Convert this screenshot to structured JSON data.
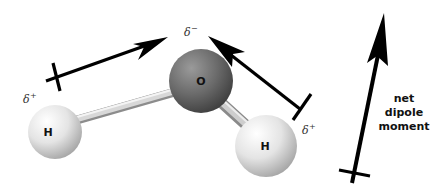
{
  "diagram": {
    "atoms": [
      {
        "id": "oxygen",
        "label": "O",
        "cx": 201,
        "cy": 81,
        "r": 32,
        "color": "#6a6a6a"
      },
      {
        "id": "hydrogen-left",
        "label": "H",
        "cx": 55,
        "cy": 132,
        "r": 27,
        "color": "#e6e6e6"
      },
      {
        "id": "hydrogen-right",
        "label": "H",
        "cx": 266,
        "cy": 146,
        "r": 31,
        "color": "#e6e6e6"
      }
    ],
    "charges": {
      "oxygen": {
        "symbol": "δ",
        "sign": "−"
      },
      "hydrogen_left": {
        "symbol": "δ",
        "sign": "+"
      },
      "hydrogen_right": {
        "symbol": "δ",
        "sign": "+"
      }
    },
    "net_dipole": {
      "line1": "net",
      "line2": "dipole",
      "line3": "moment"
    },
    "colors": {
      "arrow": "#000000",
      "bond": "#cfcfcf",
      "oxygen": "#6a6a6a",
      "hydrogen": "#e6e6e6"
    }
  }
}
